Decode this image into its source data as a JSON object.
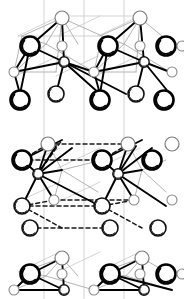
{
  "figure": {
    "width": 184,
    "height": 299,
    "background_color": "#ffffff"
  },
  "style": {
    "bond_solid_color": "#000000",
    "bond_light_color": "#b4b4b4",
    "bond_dashed_color": "#1a1a1a",
    "cell_line_color": "#c8c8c8",
    "atom_fill": "#ffffff",
    "atom_stroke_dark": "#000000",
    "atom_stroke_light": "#8c8c8c"
  },
  "legend": {
    "atom_types": [
      {
        "key": "large-bold",
        "label": "large bold-outlined atom",
        "radius": 9.5,
        "stroke_width": 2.6,
        "stroke": "#000000",
        "shadow": true
      },
      {
        "key": "medium-dark",
        "label": "medium dark-outlined atom",
        "radius": 8.0,
        "stroke_width": 1.6,
        "stroke": "#111111",
        "shadow": true
      },
      {
        "key": "medium-light",
        "label": "medium light-outlined atom",
        "radius": 7.0,
        "stroke_width": 1.2,
        "stroke": "#7a7a7a",
        "shadow": false
      },
      {
        "key": "small-light",
        "label": "small light-outlined atom",
        "radius": 5.0,
        "stroke_width": 1.1,
        "stroke": "#8c8c8c",
        "shadow": false
      },
      {
        "key": "small-dark",
        "label": "small dark-outlined atom",
        "radius": 5.2,
        "stroke_width": 1.4,
        "stroke": "#111111",
        "shadow": true
      }
    ]
  },
  "cell_lines": [
    {
      "x1": 44,
      "y1": 0,
      "x2": 44,
      "y2": 299
    },
    {
      "x1": 84,
      "y1": 0,
      "x2": 84,
      "y2": 299
    },
    {
      "x1": 124,
      "y1": 0,
      "x2": 124,
      "y2": 299
    },
    {
      "x1": 18,
      "y1": 36,
      "x2": 60,
      "y2": 16
    },
    {
      "x1": 58,
      "y1": 36,
      "x2": 100,
      "y2": 16
    },
    {
      "x1": 98,
      "y1": 36,
      "x2": 140,
      "y2": 16
    },
    {
      "x1": 18,
      "y1": 36,
      "x2": 100,
      "y2": 36
    },
    {
      "x1": 58,
      "y1": 16,
      "x2": 140,
      "y2": 16
    },
    {
      "x1": 16,
      "y1": 76,
      "x2": 58,
      "y2": 56
    },
    {
      "x1": 56,
      "y1": 76,
      "x2": 98,
      "y2": 56
    },
    {
      "x1": 96,
      "y1": 76,
      "x2": 138,
      "y2": 56
    },
    {
      "x1": 18,
      "y1": 168,
      "x2": 60,
      "y2": 148
    },
    {
      "x1": 58,
      "y1": 168,
      "x2": 100,
      "y2": 148
    },
    {
      "x1": 98,
      "y1": 168,
      "x2": 140,
      "y2": 148
    },
    {
      "x1": 18,
      "y1": 202,
      "x2": 60,
      "y2": 182
    },
    {
      "x1": 58,
      "y1": 202,
      "x2": 100,
      "y2": 182
    },
    {
      "x1": 18,
      "y1": 272,
      "x2": 60,
      "y2": 252
    },
    {
      "x1": 58,
      "y1": 272,
      "x2": 100,
      "y2": 252
    },
    {
      "x1": 98,
      "y1": 272,
      "x2": 140,
      "y2": 252
    }
  ],
  "bonds_light": [
    {
      "x1": 62,
      "y1": 18,
      "x2": 46,
      "y2": 44
    },
    {
      "x1": 62,
      "y1": 18,
      "x2": 78,
      "y2": 44
    },
    {
      "x1": 62,
      "y1": 18,
      "x2": 22,
      "y2": 36
    },
    {
      "x1": 62,
      "y1": 18,
      "x2": 102,
      "y2": 36
    },
    {
      "x1": 140,
      "y1": 18,
      "x2": 124,
      "y2": 44
    },
    {
      "x1": 140,
      "y1": 18,
      "x2": 100,
      "y2": 36
    },
    {
      "x1": 140,
      "y1": 18,
      "x2": 162,
      "y2": 36
    },
    {
      "x1": 22,
      "y1": 36,
      "x2": 46,
      "y2": 44
    },
    {
      "x1": 102,
      "y1": 36,
      "x2": 124,
      "y2": 44
    },
    {
      "x1": 22,
      "y1": 36,
      "x2": 14,
      "y2": 72
    },
    {
      "x1": 102,
      "y1": 36,
      "x2": 94,
      "y2": 72
    },
    {
      "x1": 46,
      "y1": 44,
      "x2": 14,
      "y2": 72
    },
    {
      "x1": 46,
      "y1": 44,
      "x2": 94,
      "y2": 72
    },
    {
      "x1": 124,
      "y1": 44,
      "x2": 94,
      "y2": 72
    },
    {
      "x1": 124,
      "y1": 44,
      "x2": 170,
      "y2": 72
    },
    {
      "x1": 62,
      "y1": 18,
      "x2": 56,
      "y2": 72
    },
    {
      "x1": 140,
      "y1": 18,
      "x2": 136,
      "y2": 72
    },
    {
      "x1": 14,
      "y1": 72,
      "x2": 56,
      "y2": 72
    },
    {
      "x1": 94,
      "y1": 72,
      "x2": 136,
      "y2": 72
    },
    {
      "x1": 48,
      "y1": 144,
      "x2": 62,
      "y2": 170
    },
    {
      "x1": 128,
      "y1": 144,
      "x2": 142,
      "y2": 170
    },
    {
      "x1": 48,
      "y1": 144,
      "x2": 22,
      "y2": 160
    },
    {
      "x1": 128,
      "y1": 144,
      "x2": 102,
      "y2": 160
    },
    {
      "x1": 62,
      "y1": 170,
      "x2": 102,
      "y2": 160
    },
    {
      "x1": 142,
      "y1": 170,
      "x2": 166,
      "y2": 160
    },
    {
      "x1": 62,
      "y1": 170,
      "x2": 54,
      "y2": 200
    },
    {
      "x1": 142,
      "y1": 170,
      "x2": 134,
      "y2": 200
    },
    {
      "x1": 62,
      "y1": 170,
      "x2": 98,
      "y2": 192
    },
    {
      "x1": 142,
      "y1": 170,
      "x2": 166,
      "y2": 192
    },
    {
      "x1": 62,
      "y1": 258,
      "x2": 46,
      "y2": 276
    },
    {
      "x1": 62,
      "y1": 258,
      "x2": 78,
      "y2": 276
    },
    {
      "x1": 62,
      "y1": 258,
      "x2": 22,
      "y2": 272
    },
    {
      "x1": 142,
      "y1": 258,
      "x2": 126,
      "y2": 276
    },
    {
      "x1": 142,
      "y1": 258,
      "x2": 102,
      "y2": 272
    },
    {
      "x1": 142,
      "y1": 258,
      "x2": 166,
      "y2": 272
    },
    {
      "x1": 22,
      "y1": 272,
      "x2": 46,
      "y2": 276
    },
    {
      "x1": 102,
      "y1": 272,
      "x2": 126,
      "y2": 276
    },
    {
      "x1": 46,
      "y1": 276,
      "x2": 14,
      "y2": 290
    },
    {
      "x1": 126,
      "y1": 276,
      "x2": 94,
      "y2": 290
    },
    {
      "x1": 46,
      "y1": 276,
      "x2": 94,
      "y2": 290
    },
    {
      "x1": 126,
      "y1": 276,
      "x2": 172,
      "y2": 290
    }
  ],
  "bonds_solid": [
    {
      "x1": 62,
      "y1": 18,
      "x2": 30,
      "y2": 46
    },
    {
      "x1": 62,
      "y1": 18,
      "x2": 64,
      "y2": 62
    },
    {
      "x1": 140,
      "y1": 18,
      "x2": 108,
      "y2": 46
    },
    {
      "x1": 140,
      "y1": 18,
      "x2": 144,
      "y2": 62
    },
    {
      "x1": 30,
      "y1": 46,
      "x2": 14,
      "y2": 72
    },
    {
      "x1": 30,
      "y1": 46,
      "x2": 64,
      "y2": 62
    },
    {
      "x1": 108,
      "y1": 46,
      "x2": 94,
      "y2": 72
    },
    {
      "x1": 108,
      "y1": 46,
      "x2": 144,
      "y2": 62
    },
    {
      "x1": 14,
      "y1": 72,
      "x2": 64,
      "y2": 62
    },
    {
      "x1": 94,
      "y1": 72,
      "x2": 144,
      "y2": 62
    },
    {
      "x1": 64,
      "y1": 62,
      "x2": 94,
      "y2": 72
    },
    {
      "x1": 144,
      "y1": 62,
      "x2": 170,
      "y2": 72
    },
    {
      "x1": 64,
      "y1": 62,
      "x2": 56,
      "y2": 94
    },
    {
      "x1": 144,
      "y1": 62,
      "x2": 136,
      "y2": 94
    },
    {
      "x1": 64,
      "y1": 62,
      "x2": 126,
      "y2": 94
    },
    {
      "x1": 14,
      "y1": 72,
      "x2": 20,
      "y2": 94
    },
    {
      "x1": 94,
      "y1": 72,
      "x2": 100,
      "y2": 94
    },
    {
      "x1": 30,
      "y1": 46,
      "x2": 20,
      "y2": 94
    },
    {
      "x1": 108,
      "y1": 46,
      "x2": 100,
      "y2": 94
    },
    {
      "x1": 48,
      "y1": 144,
      "x2": 38,
      "y2": 174
    },
    {
      "x1": 128,
      "y1": 144,
      "x2": 118,
      "y2": 174
    },
    {
      "x1": 38,
      "y1": 174,
      "x2": 22,
      "y2": 160
    },
    {
      "x1": 118,
      "y1": 174,
      "x2": 102,
      "y2": 160
    },
    {
      "x1": 38,
      "y1": 174,
      "x2": 62,
      "y2": 170
    },
    {
      "x1": 118,
      "y1": 174,
      "x2": 142,
      "y2": 170
    },
    {
      "x1": 38,
      "y1": 174,
      "x2": 22,
      "y2": 206
    },
    {
      "x1": 118,
      "y1": 174,
      "x2": 102,
      "y2": 206
    },
    {
      "x1": 38,
      "y1": 174,
      "x2": 100,
      "y2": 206
    },
    {
      "x1": 118,
      "y1": 174,
      "x2": 166,
      "y2": 206
    },
    {
      "x1": 38,
      "y1": 174,
      "x2": 54,
      "y2": 200
    },
    {
      "x1": 118,
      "y1": 174,
      "x2": 134,
      "y2": 200
    },
    {
      "x1": 38,
      "y1": 174,
      "x2": 56,
      "y2": 146
    },
    {
      "x1": 118,
      "y1": 174,
      "x2": 136,
      "y2": 146
    },
    {
      "x1": 22,
      "y1": 160,
      "x2": 62,
      "y2": 140
    },
    {
      "x1": 102,
      "y1": 160,
      "x2": 142,
      "y2": 140
    },
    {
      "x1": 38,
      "y1": 174,
      "x2": 72,
      "y2": 148
    },
    {
      "x1": 118,
      "y1": 174,
      "x2": 152,
      "y2": 148
    },
    {
      "x1": 62,
      "y1": 258,
      "x2": 30,
      "y2": 274
    },
    {
      "x1": 142,
      "y1": 258,
      "x2": 110,
      "y2": 274
    },
    {
      "x1": 62,
      "y1": 258,
      "x2": 64,
      "y2": 290
    },
    {
      "x1": 142,
      "y1": 258,
      "x2": 144,
      "y2": 290
    },
    {
      "x1": 30,
      "y1": 274,
      "x2": 14,
      "y2": 290
    },
    {
      "x1": 110,
      "y1": 274,
      "x2": 94,
      "y2": 290
    },
    {
      "x1": 30,
      "y1": 274,
      "x2": 64,
      "y2": 290
    },
    {
      "x1": 110,
      "y1": 274,
      "x2": 144,
      "y2": 290
    },
    {
      "x1": 14,
      "y1": 290,
      "x2": 64,
      "y2": 290
    },
    {
      "x1": 94,
      "y1": 290,
      "x2": 144,
      "y2": 290
    },
    {
      "x1": 110,
      "y1": 274,
      "x2": 172,
      "y2": 290
    },
    {
      "x1": 64,
      "y1": 62,
      "x2": 100,
      "y2": 94
    },
    {
      "x1": 144,
      "y1": 62,
      "x2": 170,
      "y2": 94
    }
  ],
  "bonds_dashed": [
    {
      "x1": 48,
      "y1": 144,
      "x2": 128,
      "y2": 144
    },
    {
      "x1": 22,
      "y1": 160,
      "x2": 102,
      "y2": 160
    },
    {
      "x1": 48,
      "y1": 144,
      "x2": 22,
      "y2": 160
    },
    {
      "x1": 128,
      "y1": 144,
      "x2": 102,
      "y2": 160
    },
    {
      "x1": 22,
      "y1": 206,
      "x2": 102,
      "y2": 206
    },
    {
      "x1": 54,
      "y1": 200,
      "x2": 134,
      "y2": 200
    },
    {
      "x1": 22,
      "y1": 206,
      "x2": 54,
      "y2": 200
    },
    {
      "x1": 102,
      "y1": 206,
      "x2": 134,
      "y2": 200
    },
    {
      "x1": 22,
      "y1": 206,
      "x2": 62,
      "y2": 228
    },
    {
      "x1": 102,
      "y1": 206,
      "x2": 142,
      "y2": 228
    },
    {
      "x1": 30,
      "y1": 228,
      "x2": 110,
      "y2": 228
    },
    {
      "x1": 38,
      "y1": 174,
      "x2": 62,
      "y2": 140
    }
  ],
  "atoms": [
    {
      "id": 1,
      "type": "medium-light",
      "x": 62,
      "y": 18,
      "layer": "top"
    },
    {
      "id": 2,
      "type": "medium-light",
      "x": 140,
      "y": 18,
      "layer": "top"
    },
    {
      "id": 3,
      "type": "large-bold",
      "x": 30,
      "y": 46,
      "layer": "top"
    },
    {
      "id": 4,
      "type": "large-bold",
      "x": 108,
      "y": 46,
      "layer": "top"
    },
    {
      "id": 5,
      "type": "large-bold",
      "x": 166,
      "y": 46,
      "layer": "top"
    },
    {
      "id": 6,
      "type": "small-light",
      "x": 62,
      "y": 46,
      "layer": "top"
    },
    {
      "id": 7,
      "type": "small-light",
      "x": 140,
      "y": 46,
      "layer": "top"
    },
    {
      "id": 8,
      "type": "small-light",
      "x": 182,
      "y": 46,
      "layer": "top"
    },
    {
      "id": 9,
      "type": "small-light",
      "x": 14,
      "y": 72,
      "layer": "top"
    },
    {
      "id": 10,
      "type": "small-dark",
      "x": 64,
      "y": 62,
      "layer": "top"
    },
    {
      "id": 11,
      "type": "small-light",
      "x": 94,
      "y": 72,
      "layer": "top"
    },
    {
      "id": 12,
      "type": "small-dark",
      "x": 144,
      "y": 62,
      "layer": "top"
    },
    {
      "id": 13,
      "type": "small-light",
      "x": 172,
      "y": 72,
      "layer": "top"
    },
    {
      "id": 14,
      "type": "medium-dark",
      "x": 56,
      "y": 94,
      "layer": "top"
    },
    {
      "id": 15,
      "type": "medium-dark",
      "x": 136,
      "y": 94,
      "layer": "top"
    },
    {
      "id": 16,
      "type": "large-bold",
      "x": 20,
      "y": 100,
      "layer": "mid-upper"
    },
    {
      "id": 17,
      "type": "large-bold",
      "x": 100,
      "y": 100,
      "layer": "mid-upper"
    },
    {
      "id": 18,
      "type": "large-bold",
      "x": 164,
      "y": 100,
      "layer": "mid-upper"
    },
    {
      "id": 19,
      "type": "medium-light",
      "x": 48,
      "y": 144,
      "layer": "middle"
    },
    {
      "id": 20,
      "type": "medium-light",
      "x": 128,
      "y": 144,
      "layer": "middle"
    },
    {
      "id": 21,
      "type": "medium-light",
      "x": 172,
      "y": 144,
      "layer": "middle"
    },
    {
      "id": 22,
      "type": "large-bold",
      "x": 22,
      "y": 160,
      "layer": "middle"
    },
    {
      "id": 23,
      "type": "large-bold",
      "x": 102,
      "y": 160,
      "layer": "middle"
    },
    {
      "id": 24,
      "type": "large-bold",
      "x": 152,
      "y": 160,
      "layer": "middle"
    },
    {
      "id": 25,
      "type": "small-dark",
      "x": 38,
      "y": 174,
      "layer": "middle"
    },
    {
      "id": 26,
      "type": "small-dark",
      "x": 118,
      "y": 174,
      "layer": "middle"
    },
    {
      "id": 27,
      "type": "small-light",
      "x": 54,
      "y": 200,
      "layer": "middle"
    },
    {
      "id": 28,
      "type": "small-light",
      "x": 134,
      "y": 200,
      "layer": "middle"
    },
    {
      "id": 29,
      "type": "small-light",
      "x": 172,
      "y": 200,
      "layer": "middle"
    },
    {
      "id": 30,
      "type": "medium-dark",
      "x": 22,
      "y": 206,
      "layer": "middle"
    },
    {
      "id": 31,
      "type": "medium-dark",
      "x": 102,
      "y": 206,
      "layer": "middle"
    },
    {
      "id": 32,
      "type": "medium-dark",
      "x": 30,
      "y": 228,
      "layer": "mid-lower"
    },
    {
      "id": 33,
      "type": "medium-dark",
      "x": 110,
      "y": 228,
      "layer": "mid-lower"
    },
    {
      "id": 34,
      "type": "medium-dark",
      "x": 158,
      "y": 228,
      "layer": "mid-lower"
    },
    {
      "id": 35,
      "type": "medium-light",
      "x": 62,
      "y": 258,
      "layer": "bottom"
    },
    {
      "id": 36,
      "type": "medium-light",
      "x": 142,
      "y": 258,
      "layer": "bottom"
    },
    {
      "id": 37,
      "type": "large-bold",
      "x": 30,
      "y": 274,
      "layer": "bottom"
    },
    {
      "id": 38,
      "type": "large-bold",
      "x": 110,
      "y": 274,
      "layer": "bottom"
    },
    {
      "id": 39,
      "type": "large-bold",
      "x": 166,
      "y": 274,
      "layer": "bottom"
    },
    {
      "id": 40,
      "type": "small-light",
      "x": 62,
      "y": 274,
      "layer": "bottom"
    },
    {
      "id": 41,
      "type": "small-light",
      "x": 140,
      "y": 274,
      "layer": "bottom"
    },
    {
      "id": 42,
      "type": "small-light",
      "x": 182,
      "y": 274,
      "layer": "bottom"
    },
    {
      "id": 43,
      "type": "small-light",
      "x": 14,
      "y": 290,
      "layer": "bottom"
    },
    {
      "id": 44,
      "type": "small-dark",
      "x": 64,
      "y": 290,
      "layer": "bottom"
    },
    {
      "id": 45,
      "type": "small-light",
      "x": 94,
      "y": 290,
      "layer": "bottom"
    },
    {
      "id": 46,
      "type": "small-dark",
      "x": 144,
      "y": 290,
      "layer": "bottom"
    }
  ]
}
